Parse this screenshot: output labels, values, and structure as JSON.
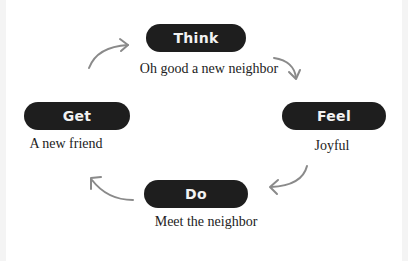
{
  "diagram": {
    "type": "cycle",
    "colors": {
      "pill_bg": "#1e1e1e",
      "pill_text": "#f2f2f2",
      "arrow": "#8a8a8a",
      "caption": "#222222"
    },
    "nodes": [
      {
        "id": "think",
        "label": "Think",
        "caption": "Oh good a new neighbor"
      },
      {
        "id": "feel",
        "label": "Feel",
        "caption": "Joyful"
      },
      {
        "id": "do",
        "label": "Do",
        "caption": "Meet the neighbor"
      },
      {
        "id": "get",
        "label": "Get",
        "caption": "A new friend"
      }
    ],
    "edges": [
      {
        "from": "think",
        "to": "feel"
      },
      {
        "from": "feel",
        "to": "do"
      },
      {
        "from": "do",
        "to": "get"
      },
      {
        "from": "get",
        "to": "think"
      }
    ]
  }
}
